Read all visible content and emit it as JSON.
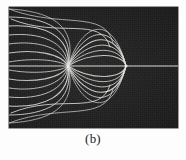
{
  "figure": {
    "caption": "(b)",
    "panel": {
      "label": "field-line-photograph",
      "background_color": "#1d1d1d",
      "line_color": "#e8e8e4",
      "x_px": 9,
      "y_px": 7,
      "width_px": 169,
      "height_px": 121
    }
  },
  "chart_data": {
    "type": "line",
    "title": "",
    "subtitle": "",
    "xlabel": "",
    "ylabel": "",
    "annotations": [
      "(b)"
    ],
    "legend": [],
    "legend_position": "none",
    "grid": false,
    "axis_ranges": {
      "xlim": [
        0,
        169
      ],
      "ylim": [
        0,
        121
      ]
    },
    "features": {
      "axis_line": {
        "name": "horizontal-symmetry-axis",
        "y": 59,
        "x_start": 0,
        "x_end": 169,
        "color": "#e2e2dc",
        "width_px": 1.2
      },
      "singular_points": [
        {
          "name": "left-node",
          "x": 59,
          "y": 59
        },
        {
          "name": "right-cusp",
          "x": 117,
          "y": 59
        }
      ],
      "arm_count_per_quadrant": 7,
      "symmetry": "mirror about horizontal midline"
    },
    "series": [
      {
        "name": "upper-left-fan",
        "quadrant": "upper-left",
        "curves": [
          {
            "start": [
              0,
              2
            ],
            "control1": [
              38,
              4
            ],
            "control2": [
              70,
              16
            ],
            "end": [
              59,
              59
            ]
          },
          {
            "start": [
              0,
              10
            ],
            "control1": [
              36,
              10
            ],
            "control2": [
              66,
              22
            ],
            "end": [
              59,
              59
            ]
          },
          {
            "start": [
              0,
              19
            ],
            "control1": [
              33,
              17
            ],
            "control2": [
              62,
              28
            ],
            "end": [
              59,
              59
            ]
          },
          {
            "start": [
              0,
              28
            ],
            "control1": [
              30,
              25
            ],
            "control2": [
              58,
              34
            ],
            "end": [
              59,
              59
            ]
          },
          {
            "start": [
              0,
              37
            ],
            "control1": [
              27,
              33
            ],
            "control2": [
              55,
              40
            ],
            "end": [
              59,
              59
            ]
          },
          {
            "start": [
              0,
              46
            ],
            "control1": [
              24,
              42
            ],
            "control2": [
              52,
              46
            ],
            "end": [
              59,
              59
            ]
          },
          {
            "start": [
              0,
              55
            ],
            "control1": [
              21,
              51
            ],
            "control2": [
              49,
              52
            ],
            "end": [
              59,
              59
            ]
          }
        ]
      },
      {
        "name": "upper-sweep-outer",
        "quadrant": "upper",
        "curves": [
          {
            "start": [
              0,
              2
            ],
            "control1": [
              52,
              22
            ],
            "control2": [
              96,
              2
            ],
            "end": [
              104,
              36
            ]
          },
          {
            "start": [
              2,
              12
            ],
            "control1": [
              50,
              32
            ],
            "control2": [
              92,
              8
            ],
            "end": [
              101,
              40
            ]
          }
        ]
      },
      {
        "name": "upper-right-fan",
        "quadrant": "upper-right",
        "curves": [
          {
            "start": [
              59,
              59
            ],
            "control1": [
              73,
              14
            ],
            "control2": [
              104,
              6
            ],
            "end": [
              117,
              59
            ]
          },
          {
            "start": [
              59,
              59
            ],
            "control1": [
              75,
              20
            ],
            "control2": [
              106,
              14
            ],
            "end": [
              117,
              59
            ]
          },
          {
            "start": [
              59,
              59
            ],
            "control1": [
              77,
              26
            ],
            "control2": [
              108,
              22
            ],
            "end": [
              117,
              59
            ]
          },
          {
            "start": [
              59,
              59
            ],
            "control1": [
              79,
              32
            ],
            "control2": [
              110,
              30
            ],
            "end": [
              117,
              59
            ]
          },
          {
            "start": [
              59,
              59
            ],
            "control1": [
              81,
              38
            ],
            "control2": [
              112,
              38
            ],
            "end": [
              117,
              59
            ]
          },
          {
            "start": [
              59,
              59
            ],
            "control1": [
              83,
              44
            ],
            "control2": [
              114,
              46
            ],
            "end": [
              117,
              59
            ]
          }
        ]
      },
      {
        "name": "lower-left-fan",
        "quadrant": "lower-left",
        "curves": [
          {
            "start": [
              0,
              116
            ],
            "control1": [
              38,
              114
            ],
            "control2": [
              70,
              102
            ],
            "end": [
              59,
              59
            ]
          },
          {
            "start": [
              0,
              108
            ],
            "control1": [
              36,
              108
            ],
            "control2": [
              66,
              96
            ],
            "end": [
              59,
              59
            ]
          },
          {
            "start": [
              0,
              99
            ],
            "control1": [
              33,
              101
            ],
            "control2": [
              62,
              90
            ],
            "end": [
              59,
              59
            ]
          },
          {
            "start": [
              0,
              90
            ],
            "control1": [
              30,
              93
            ],
            "control2": [
              58,
              84
            ],
            "end": [
              59,
              59
            ]
          },
          {
            "start": [
              0,
              81
            ],
            "control1": [
              27,
              85
            ],
            "control2": [
              55,
              78
            ],
            "end": [
              59,
              59
            ]
          },
          {
            "start": [
              0,
              72
            ],
            "control1": [
              24,
              76
            ],
            "control2": [
              52,
              72
            ],
            "end": [
              59,
              59
            ]
          },
          {
            "start": [
              0,
              63
            ],
            "control1": [
              21,
              67
            ],
            "control2": [
              49,
              66
            ],
            "end": [
              59,
              59
            ]
          }
        ]
      },
      {
        "name": "lower-sweep-outer",
        "quadrant": "lower",
        "curves": [
          {
            "start": [
              0,
              116
            ],
            "control1": [
              52,
              96
            ],
            "control2": [
              96,
              116
            ],
            "end": [
              104,
              82
            ]
          },
          {
            "start": [
              2,
              106
            ],
            "control1": [
              50,
              86
            ],
            "control2": [
              92,
              110
            ],
            "end": [
              101,
              78
            ]
          }
        ]
      },
      {
        "name": "lower-right-fan",
        "quadrant": "lower-right",
        "curves": [
          {
            "start": [
              59,
              59
            ],
            "control1": [
              73,
              104
            ],
            "control2": [
              104,
              112
            ],
            "end": [
              117,
              59
            ]
          },
          {
            "start": [
              59,
              59
            ],
            "control1": [
              75,
              98
            ],
            "control2": [
              106,
              104
            ],
            "end": [
              117,
              59
            ]
          },
          {
            "start": [
              59,
              59
            ],
            "control1": [
              77,
              92
            ],
            "control2": [
              108,
              96
            ],
            "end": [
              117,
              59
            ]
          },
          {
            "start": [
              59,
              59
            ],
            "control1": [
              79,
              86
            ],
            "control2": [
              110,
              88
            ],
            "end": [
              117,
              59
            ]
          },
          {
            "start": [
              59,
              59
            ],
            "control1": [
              81,
              80
            ],
            "control2": [
              112,
              80
            ],
            "end": [
              117,
              59
            ]
          },
          {
            "start": [
              59,
              59
            ],
            "control1": [
              83,
              74
            ],
            "control2": [
              114,
              72
            ],
            "end": [
              117,
              59
            ]
          }
        ]
      }
    ]
  }
}
